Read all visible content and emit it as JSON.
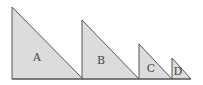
{
  "diagram": {
    "type": "similar right triangles",
    "baseline_y": 79,
    "colors": {
      "fill": "#dcdcdc",
      "stroke": "#555555",
      "label": "#444444"
    },
    "triangles": [
      {
        "label": "A",
        "left_x": 12,
        "right_x": 83,
        "apex_y": 7,
        "label_x": 37,
        "label_y": 58
      },
      {
        "label": "B",
        "left_x": 82,
        "right_x": 139,
        "apex_y": 20,
        "label_x": 101,
        "label_y": 61
      },
      {
        "label": "C",
        "left_x": 139,
        "right_x": 172,
        "apex_y": 44,
        "label_x": 151,
        "label_y": 69
      },
      {
        "label": "D",
        "left_x": 172,
        "right_x": 191,
        "apex_y": 58,
        "label_x": 178,
        "label_y": 72
      }
    ]
  }
}
